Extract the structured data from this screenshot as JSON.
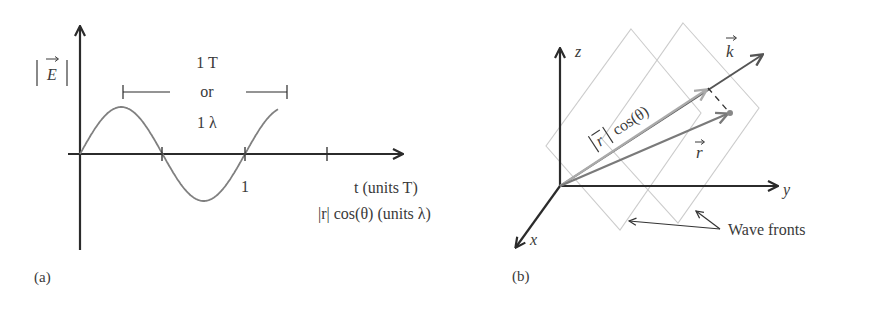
{
  "panel_a": {
    "label": "(a)",
    "y_axis_label": "E",
    "period_line1": "1 T",
    "period_line2": "or",
    "period_line3": "1 λ",
    "tick_label": "1",
    "x_axis_label_1": "t (units T)",
    "x_axis_label_2": "|r| cos(θ) (units λ)",
    "wave": {
      "function": "sine",
      "cycles_shown": 1.2,
      "period": 1
    }
  },
  "panel_b": {
    "label": "(b)",
    "axis_z": "z",
    "axis_y": "y",
    "axis_x": "x",
    "vector_k": "k",
    "vector_r": "r",
    "projection_label": "|r| cos(θ)",
    "wavefronts_label": "Wave fronts"
  },
  "colors": {
    "axis": "#2b2b2b",
    "wave": "#808080",
    "k_vector": "#555555",
    "projection": "#aaaaaa",
    "r_vector": "#7a7a7a",
    "wavefront": "#cccccc"
  }
}
